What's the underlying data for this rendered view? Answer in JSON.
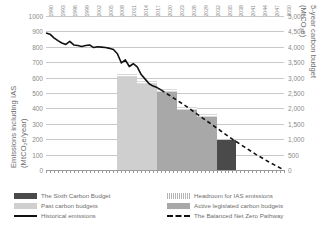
{
  "axes": {
    "left_title_line1": "Emissions including IAS",
    "left_title_line2": "(MtCO₂e/year)",
    "right_title_line1": "5-year carbon budget",
    "right_title_line2": "(MtCO₂e)"
  },
  "legend": {
    "sixth": "The Sixth Carbon Budget",
    "past": "Past carbon budgets",
    "historical": "Historical emissions",
    "headroom": "Headroom for IAS emissions",
    "active": "Active legislated carbon budgets",
    "pathway": "The Balanced Net Zero Pathway"
  },
  "colors": {
    "sixth": "#4a4a4a",
    "past": "#cfcfcf",
    "active": "#a8a8a8",
    "headroom": "#d8d8d8",
    "line": "#111111",
    "grid": "#c9c9c9"
  },
  "chart_data": {
    "type": "bar",
    "title": "",
    "xlabel": "",
    "ylabel": "Emissions including IAS (MtCO₂e/year)",
    "ylabel_right": "5-year carbon budget (MtCO₂e)",
    "ylim": [
      0,
      1000
    ],
    "ylim_right": [
      0,
      5000
    ],
    "yticks": [
      0,
      100,
      200,
      300,
      400,
      500,
      600,
      700,
      800,
      900,
      1000
    ],
    "yticks_right": [
      0,
      500,
      1000,
      1500,
      2000,
      2500,
      3000,
      3500,
      4000,
      4500,
      5000
    ],
    "grid": true,
    "legend_position": "below",
    "xlim": [
      1990,
      2050
    ],
    "xticks": [
      1990,
      1993,
      1996,
      1999,
      2002,
      2005,
      2008,
      2011,
      2014,
      2017,
      2020,
      2023,
      2026,
      2029,
      2032,
      2035,
      2038,
      2041,
      2044,
      2047,
      2050
    ],
    "series": [
      {
        "name": "Historical emissions",
        "type": "line",
        "x": [
          1990,
          1991,
          1992,
          1993,
          1994,
          1995,
          1996,
          1997,
          1998,
          1999,
          2000,
          2001,
          2002,
          2003,
          2004,
          2005,
          2006,
          2007,
          2008,
          2009,
          2010,
          2011,
          2012,
          2013,
          2014,
          2015,
          2016,
          2017,
          2018,
          2019
        ],
        "values": [
          890,
          882,
          858,
          840,
          825,
          815,
          835,
          812,
          808,
          802,
          808,
          812,
          795,
          800,
          798,
          795,
          790,
          782,
          755,
          695,
          715,
          672,
          690,
          670,
          620,
          590,
          560,
          545,
          535,
          520
        ]
      },
      {
        "name": "The Balanced Net Zero Pathway",
        "type": "line-dashed",
        "x": [
          2019,
          2022,
          2025,
          2028,
          2031,
          2034,
          2037,
          2040,
          2043,
          2046,
          2050
        ],
        "values": [
          520,
          470,
          420,
          365,
          310,
          255,
          200,
          150,
          100,
          55,
          0
        ]
      },
      {
        "name": "Past carbon budgets",
        "type": "bar",
        "periods": [
          "2008-2012",
          "2013-2017"
        ],
        "values": [
          3018,
          2782
        ]
      },
      {
        "name": "Active legislated carbon budgets",
        "type": "bar",
        "periods": [
          "2018-2022",
          "2023-2027",
          "2028-2032"
        ],
        "values": [
          2544,
          1950,
          1725
        ]
      },
      {
        "name": "The Sixth Carbon Budget",
        "type": "bar",
        "periods": [
          "2033-2037"
        ],
        "values": [
          965
        ]
      },
      {
        "name": "Headroom for IAS emissions",
        "type": "bar-overlay",
        "periods": [
          "2008-2012",
          "2013-2017",
          "2018-2022",
          "2023-2027",
          "2028-2032"
        ],
        "values": [
          120,
          110,
          100,
          95,
          90
        ]
      }
    ]
  }
}
